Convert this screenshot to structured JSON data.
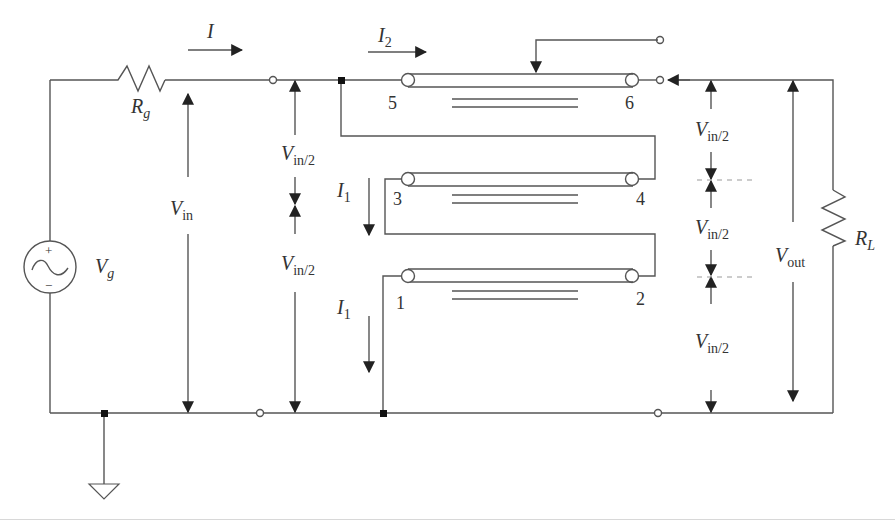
{
  "diagram": {
    "source": {
      "symbol": "V",
      "sub": "g",
      "plus": "+",
      "minus": "−"
    },
    "source_resistor": {
      "symbol": "R",
      "sub": "g"
    },
    "load_resistor": {
      "symbol": "R",
      "sub": "L"
    },
    "currents": {
      "main": {
        "symbol": "I"
      },
      "line_top": {
        "symbol": "I",
        "sub": "2"
      },
      "line_mid": {
        "symbol": "I",
        "sub": "1"
      },
      "line_bottom": {
        "symbol": "I",
        "sub": "1"
      }
    },
    "voltages": {
      "vin": {
        "symbol": "V",
        "sub": "in"
      },
      "vin_half_upper": {
        "symbol": "V",
        "sub": "in/2"
      },
      "vin_half_lower": {
        "symbol": "V",
        "sub": "in/2"
      },
      "vout": {
        "symbol": "V",
        "sub": "out"
      },
      "right_half_1": {
        "symbol": "V",
        "sub": "in/2"
      },
      "right_half_2": {
        "symbol": "V",
        "sub": "in/2"
      },
      "right_half_3": {
        "symbol": "V",
        "sub": "in/2"
      }
    },
    "transmission_lines": [
      {
        "name": "line-5-6",
        "left_port": "5",
        "right_port": "6"
      },
      {
        "name": "line-3-4",
        "left_port": "3",
        "right_port": "4"
      },
      {
        "name": "line-1-2",
        "left_port": "1",
        "right_port": "2"
      }
    ],
    "colors": {
      "wire": "#555555",
      "text": "#333333",
      "dashed": "#999999",
      "background": "#ffffff"
    }
  }
}
